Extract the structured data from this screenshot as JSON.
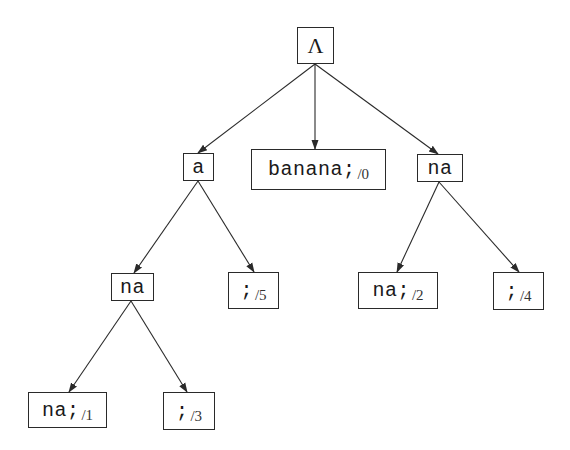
{
  "diagram": {
    "title": "",
    "type": "suffix-tree",
    "colors": {
      "stroke": "#2a2a2a",
      "text": "#1a1a1a",
      "background": "#ffffff"
    },
    "nodes": {
      "root": {
        "label": "Λ",
        "sub": ""
      },
      "a": {
        "label": "a",
        "sub": ""
      },
      "banana": {
        "label": "banana;",
        "sub": "/0"
      },
      "na_r": {
        "label": "na",
        "sub": ""
      },
      "na_l": {
        "label": "na",
        "sub": ""
      },
      "semi5": {
        "label": ";",
        "sub": "/5"
      },
      "na2": {
        "label": "na;",
        "sub": "/2"
      },
      "semi4": {
        "label": ";",
        "sub": "/4"
      },
      "na1": {
        "label": "na;",
        "sub": "/1"
      },
      "semi3": {
        "label": ";",
        "sub": "/3"
      }
    },
    "edges": [
      {
        "from": "root",
        "to": "a"
      },
      {
        "from": "root",
        "to": "banana"
      },
      {
        "from": "root",
        "to": "na_r"
      },
      {
        "from": "a",
        "to": "na_l"
      },
      {
        "from": "a",
        "to": "semi5"
      },
      {
        "from": "na_r",
        "to": "na2"
      },
      {
        "from": "na_r",
        "to": "semi4"
      },
      {
        "from": "na_l",
        "to": "na1"
      },
      {
        "from": "na_l",
        "to": "semi3"
      }
    ]
  }
}
